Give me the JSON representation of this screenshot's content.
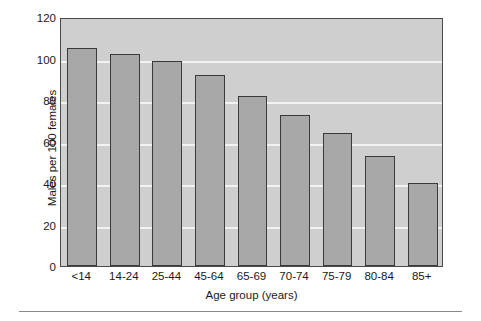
{
  "chart_data": {
    "type": "bar",
    "title": "",
    "subtitle": "",
    "xlabel": "Age group (years)",
    "ylabel": "Males per 100 females",
    "categories": [
      "<14",
      "14-24",
      "25-44",
      "45-64",
      "65-69",
      "70-74",
      "75-79",
      "80-84",
      "85+"
    ],
    "values": [
      105,
      102,
      99,
      92,
      82,
      73,
      64,
      53,
      40
    ],
    "series": [
      {
        "name": "Males per 100 females",
        "values": [
          105,
          102,
          99,
          92,
          82,
          73,
          64,
          53,
          40
        ]
      }
    ],
    "ylim": [
      0,
      120
    ],
    "yticks": [
      0,
      20,
      40,
      60,
      80,
      100,
      120
    ],
    "ytick_labels": [
      "0",
      "20",
      "40",
      "60",
      "80",
      "100",
      "120"
    ],
    "grid": true,
    "grid_axis": "y",
    "legend": false,
    "legend_position": "none",
    "annotations": [],
    "colors": {
      "bar_fill": "#a8a8a8",
      "bar_edge": "#3a3a3a",
      "plot_background": "#cfcfcf",
      "gridline": "#f2f2f2",
      "axis_frame": "#4a4a4a",
      "text": "#1a1a1a",
      "canvas_background": "#ffffff",
      "rule": "#8a8a8a"
    }
  }
}
